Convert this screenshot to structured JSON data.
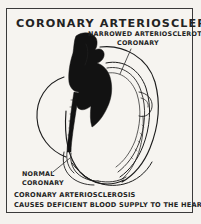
{
  "plate": {
    "title": "CORONARY  ARTERIOSCLEROSIS",
    "background_color": "#f4f2ee",
    "ink_color": "#1c1c1c",
    "frame_color": "#3a3a3a",
    "plaque_color": "#121212"
  },
  "labels": {
    "narrowed_line1": "NARROWED ARTERIOSCLEROTIC",
    "narrowed_line2": "CORONARY",
    "normal_line1": "NORMAL",
    "normal_line2": "CORONARY"
  },
  "caption": {
    "line1": "CORONARY  ARTERIOSCLEROSIS",
    "line2": "CAUSES DEFICIENT BLOOD SUPPLY TO THE HEART MUSCLE"
  },
  "figure": {
    "narrowed_vessel_label": "narrowed-arteriosclerotic-coronary-artery",
    "normal_vessel_label": "normal-coronary-artery"
  }
}
